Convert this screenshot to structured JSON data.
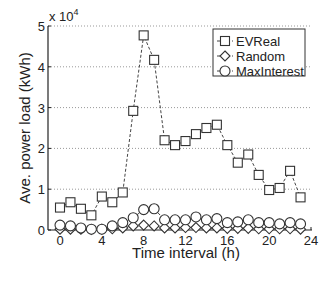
{
  "chart_data": {
    "type": "line",
    "title": "",
    "xlabel": "Time interval (h)",
    "ylabel": "Ave. power load (kWh)",
    "y_multiplier_label": "x 10",
    "y_multiplier_exponent": "4",
    "xlim": [
      -1,
      24
    ],
    "ylim": [
      0,
      5
    ],
    "x_ticks": [
      0,
      4,
      8,
      12,
      16,
      20,
      24
    ],
    "y_ticks": [
      0,
      1,
      2,
      3,
      4,
      5
    ],
    "grid": "horizontal-dotted",
    "legend_position": "top-right",
    "x": [
      0,
      1,
      2,
      3,
      4,
      5,
      6,
      7,
      8,
      9,
      10,
      11,
      12,
      13,
      14,
      15,
      16,
      17,
      18,
      19,
      20,
      21,
      22,
      23
    ],
    "series": [
      {
        "name": "EVReal",
        "marker": "square",
        "line": "dashed",
        "values": [
          0.55,
          0.68,
          0.52,
          0.36,
          0.82,
          0.68,
          0.92,
          2.92,
          4.77,
          4.17,
          2.2,
          2.08,
          2.18,
          2.35,
          2.5,
          2.58,
          2.08,
          1.65,
          1.85,
          1.35,
          0.98,
          1.03,
          1.45,
          0.8
        ]
      },
      {
        "name": "Random",
        "marker": "diamond",
        "line": "dashed",
        "values": [
          0.02,
          0.02,
          0.02,
          0.01,
          0.02,
          0.03,
          0.05,
          0.1,
          0.12,
          0.1,
          0.05,
          0.05,
          0.06,
          0.06,
          0.05,
          0.05,
          0.04,
          0.04,
          0.04,
          0.03,
          0.03,
          0.03,
          0.03,
          0.02
        ]
      },
      {
        "name": "MaxInterest",
        "marker": "circle",
        "line": "dashed",
        "values": [
          0.12,
          0.1,
          0.05,
          0.02,
          0.02,
          0.1,
          0.18,
          0.3,
          0.5,
          0.52,
          0.25,
          0.25,
          0.25,
          0.32,
          0.25,
          0.28,
          0.18,
          0.2,
          0.25,
          0.18,
          0.18,
          0.15,
          0.18,
          0.15
        ]
      }
    ]
  }
}
